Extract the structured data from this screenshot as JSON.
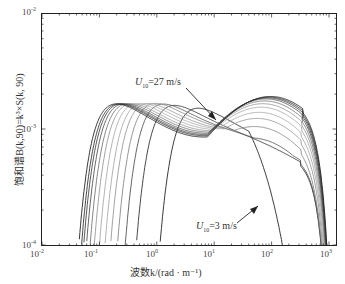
{
  "chart_data": {
    "type": "line",
    "title": "",
    "xlabel": "波数k/(rad · m⁻¹)",
    "ylabel": "饱和谱B(k,90)=k³×S(k, 90)",
    "xscale": "log",
    "yscale": "log",
    "xlim": [
      0.01,
      1500
    ],
    "ylim": [
      0.0001,
      0.01
    ],
    "x_tick_labels": [
      "10⁻²",
      "10⁻¹",
      "10⁰",
      "10¹",
      "10²",
      "10³"
    ],
    "y_tick_labels": [
      "10⁻²",
      "10⁻³",
      "10⁻⁴"
    ],
    "grid": false,
    "annotations": [
      {
        "text": "U₁₀=27 m/s",
        "points_to": "upper curve near k≈8, B≈1.1e-3"
      },
      {
        "text": "U₁₀=3 m/s",
        "points_to": "lower curve near k≈30, B≈2.2e-4"
      }
    ],
    "series": [
      {
        "name": "U10=3 m/s",
        "peak_k": 1.8,
        "peak_B": 0.00062,
        "hf_peak_B": 0.00022,
        "color": "#222"
      },
      {
        "name": "U10=5 m/s",
        "peak_k": 0.7,
        "peak_B": 0.00066,
        "hf_peak_B": 0.00042,
        "color": "#333"
      },
      {
        "name": "U10=7 m/s",
        "peak_k": 0.45,
        "peak_B": 0.00068,
        "hf_peak_B": 0.00062,
        "color": "#555"
      },
      {
        "name": "U10=9 m/s",
        "peak_k": 0.33,
        "peak_B": 0.00069,
        "hf_peak_B": 0.00085,
        "color": "#888"
      },
      {
        "name": "U10=11 m/s",
        "peak_k": 0.25,
        "peak_B": 0.00069,
        "hf_peak_B": 0.00105,
        "color": "#999"
      },
      {
        "name": "U10=13 m/s",
        "peak_k": 0.2,
        "peak_B": 0.00069,
        "hf_peak_B": 0.00122,
        "color": "#aaa"
      },
      {
        "name": "U10=15 m/s",
        "peak_k": 0.16,
        "peak_B": 0.00069,
        "hf_peak_B": 0.00138,
        "color": "#aaa"
      },
      {
        "name": "U10=17 m/s",
        "peak_k": 0.13,
        "peak_B": 0.00069,
        "hf_peak_B": 0.0015,
        "color": "#999"
      },
      {
        "name": "U10=19 m/s",
        "peak_k": 0.11,
        "peak_B": 0.00069,
        "hf_peak_B": 0.0016,
        "color": "#777"
      },
      {
        "name": "U10=21 m/s",
        "peak_k": 0.095,
        "peak_B": 0.00069,
        "hf_peak_B": 0.00168,
        "color": "#555"
      },
      {
        "name": "U10=23 m/s",
        "peak_k": 0.085,
        "peak_B": 0.00069,
        "hf_peak_B": 0.00172,
        "color": "#444"
      },
      {
        "name": "U10=25 m/s",
        "peak_k": 0.078,
        "peak_B": 0.00069,
        "hf_peak_B": 0.00175,
        "color": "#333"
      },
      {
        "name": "U10=27 m/s",
        "peak_k": 0.07,
        "peak_B": 0.00069,
        "hf_peak_B": 0.00178,
        "color": "#222"
      }
    ]
  },
  "axes": {
    "x_ticks": [
      {
        "label": "10",
        "exp": "-2"
      },
      {
        "label": "10",
        "exp": "-1"
      },
      {
        "label": "10",
        "exp": "0"
      },
      {
        "label": "10",
        "exp": "1"
      },
      {
        "label": "10",
        "exp": "2"
      },
      {
        "label": "10",
        "exp": "3"
      }
    ],
    "y_ticks": [
      {
        "label": "10",
        "exp": "-2"
      },
      {
        "label": "10",
        "exp": "-3"
      },
      {
        "label": "10",
        "exp": "-4"
      }
    ],
    "xlabel": "波数k/(rad · m⁻¹)",
    "ylabel": "饱和谱B(k,90)=k³×S(k, 90)"
  },
  "annotations": {
    "high": {
      "U": "U",
      "sub": "10",
      "rest": "=27 m/s"
    },
    "low": {
      "U": "U",
      "sub": "10",
      "rest": "=3 m/s"
    }
  }
}
